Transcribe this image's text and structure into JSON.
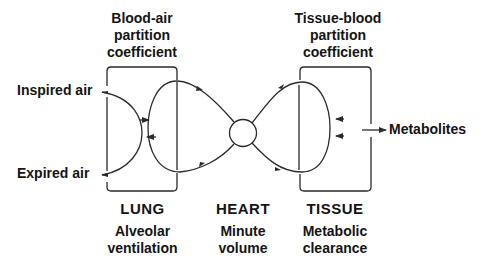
{
  "diagram": {
    "type": "physiological-flow-model",
    "top_labels": {
      "blood_air": [
        "Blood-air",
        "partition",
        "coefficient"
      ],
      "tissue_blood": [
        "Tissue-blood",
        "partition",
        "coefficient"
      ]
    },
    "side_labels": {
      "inspired_air": "Inspired air",
      "expired_air": "Expired air",
      "metabolites": "Metabolites"
    },
    "compartments": [
      {
        "name": "LUNG",
        "parameter": [
          "Alveolar",
          "ventilation"
        ]
      },
      {
        "name": "HEART",
        "parameter": [
          "Minute",
          "volume"
        ]
      },
      {
        "name": "TISSUE",
        "parameter": [
          "Metabolic",
          "clearance"
        ]
      }
    ],
    "colors": {
      "line": "#2a2a2a",
      "text": "#141414",
      "background": "#ffffff"
    }
  }
}
